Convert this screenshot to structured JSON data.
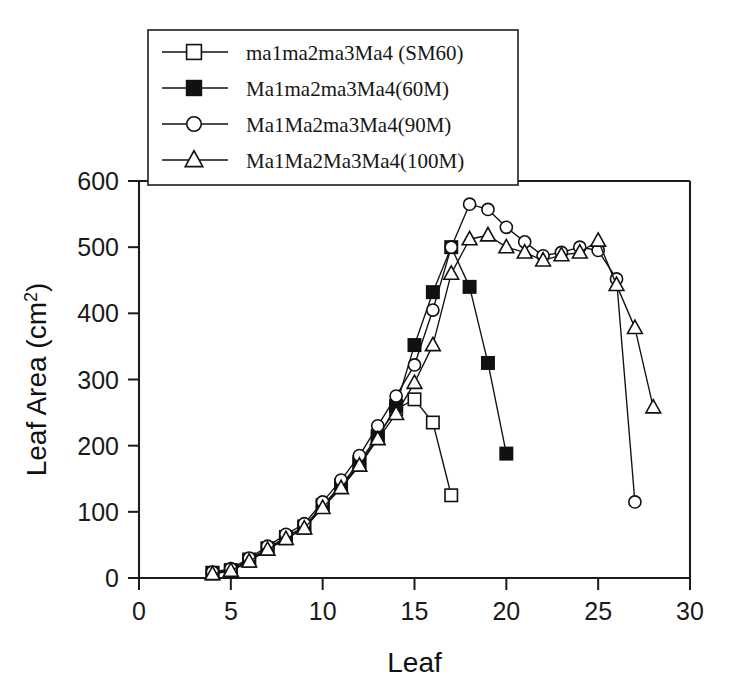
{
  "chart_data": {
    "type": "line",
    "title": "",
    "xlabel": "Leaf",
    "ylabel": "Leaf Area (cm2)",
    "ylabel_base": "Leaf Area (cm",
    "ylabel_sup": "2",
    "ylabel_close": ")",
    "xlim": [
      0,
      30
    ],
    "ylim": [
      0,
      600
    ],
    "xticks": [
      0,
      5,
      10,
      15,
      20,
      25,
      30
    ],
    "yticks": [
      0,
      100,
      200,
      300,
      400,
      500,
      600
    ],
    "xtick_labels": [
      "0",
      "5",
      "10",
      "15",
      "20",
      "25",
      "30"
    ],
    "ytick_labels": [
      "0",
      "100",
      "200",
      "300",
      "400",
      "500",
      "600"
    ],
    "grid": false,
    "legend_position": "top-left-inside",
    "series": [
      {
        "name": "ma1ma2ma3Ma4 (SM60)",
        "marker": "open-square",
        "x": [
          4,
          5,
          6,
          7,
          8,
          9,
          10,
          11,
          12,
          13,
          14,
          15,
          16,
          17
        ],
        "values": [
          8,
          12,
          28,
          45,
          62,
          78,
          110,
          140,
          175,
          215,
          255,
          270,
          235,
          125
        ]
      },
      {
        "name": "Ma1ma2ma3Ma4(60M)",
        "marker": "filled-square",
        "x": [
          4,
          5,
          6,
          7,
          8,
          9,
          10,
          11,
          12,
          13,
          14,
          15,
          16,
          17,
          18,
          19,
          20
        ],
        "values": [
          7,
          10,
          26,
          44,
          60,
          76,
          108,
          138,
          172,
          212,
          260,
          352,
          432,
          500,
          440,
          325,
          188
        ]
      },
      {
        "name": "Ma1Ma2ma3Ma4(90M)",
        "marker": "open-circle",
        "x": [
          4,
          5,
          6,
          7,
          8,
          9,
          10,
          11,
          12,
          13,
          14,
          15,
          16,
          17,
          18,
          19,
          20,
          21,
          22,
          23,
          24,
          25,
          26,
          27
        ],
        "values": [
          9,
          14,
          30,
          48,
          66,
          82,
          115,
          148,
          185,
          230,
          275,
          322,
          405,
          500,
          565,
          557,
          530,
          508,
          487,
          492,
          500,
          495,
          452,
          115
        ]
      },
      {
        "name": "Ma1Ma2Ma3Ma4(100M)",
        "marker": "open-triangle",
        "x": [
          4,
          5,
          6,
          7,
          8,
          9,
          10,
          11,
          12,
          13,
          14,
          15,
          16,
          17,
          18,
          19,
          20,
          21,
          22,
          23,
          24,
          25,
          26,
          27,
          28
        ],
        "values": [
          6,
          11,
          25,
          43,
          59,
          75,
          106,
          136,
          170,
          210,
          248,
          295,
          352,
          460,
          512,
          518,
          500,
          492,
          480,
          488,
          492,
          510,
          443,
          378,
          258
        ]
      }
    ]
  },
  "legend": {
    "entries": [
      {
        "label": "ma1ma2ma3Ma4 (SM60)",
        "marker": "open-square"
      },
      {
        "label": "Ma1ma2ma3Ma4(60M)",
        "marker": "filled-square"
      },
      {
        "label": "Ma1Ma2ma3Ma4(90M)",
        "marker": "open-circle"
      },
      {
        "label": "Ma1Ma2Ma3Ma4(100M)",
        "marker": "open-triangle"
      }
    ]
  },
  "colors": {
    "ink": "#111111",
    "background": "#ffffff"
  }
}
